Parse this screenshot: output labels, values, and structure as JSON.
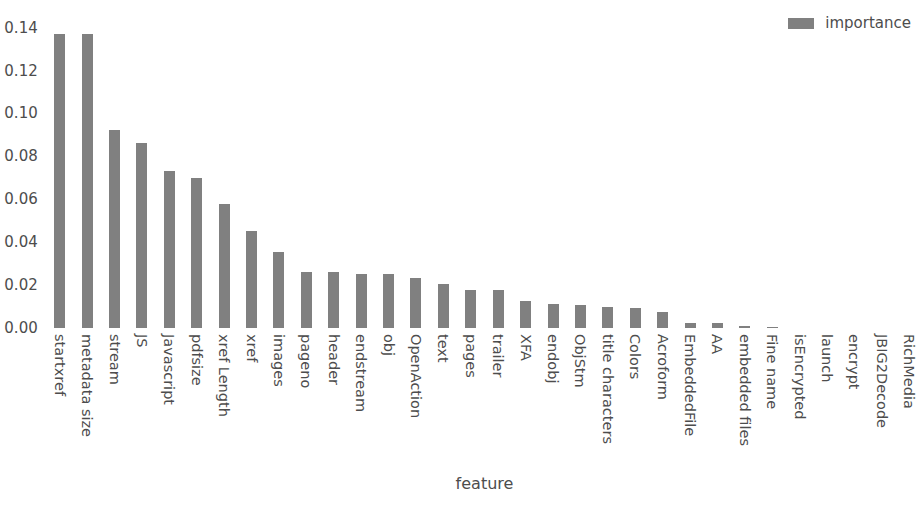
{
  "chart_data": {
    "type": "bar",
    "title": "",
    "xlabel": "feature",
    "ylabel": "",
    "ylim": [
      0.0,
      0.144
    ],
    "yticks": [
      "0.00",
      "0.02",
      "0.04",
      "0.06",
      "0.08",
      "0.10",
      "0.12",
      "0.14"
    ],
    "ytick_values": [
      0.0,
      0.02,
      0.04,
      0.06,
      0.08,
      0.1,
      0.12,
      0.14
    ],
    "grid": false,
    "legend": {
      "position": "upper right",
      "entries": [
        "importance"
      ]
    },
    "bar_color": "#808080",
    "background_color": "#ffffff",
    "text_color": "#4d4d4d",
    "categories": [
      "startxref",
      "metadata size",
      "stream",
      "JS",
      "Javascript",
      "pdfsize",
      "xref Length",
      "xref",
      "images",
      "pageno",
      "header",
      "endstream",
      "obj",
      "OpenAction",
      "text",
      "pages",
      "trailer",
      "XFA",
      "endobj",
      "ObjStm",
      "title characters",
      "Colors",
      "Acroform",
      "EmbeddedFile",
      "AA",
      "embedded files",
      "Fine name",
      "isEncrypted",
      "launch",
      "encrypt",
      "JBIG2Decode",
      "RichMedia"
    ],
    "series": [
      {
        "name": "importance",
        "values": [
          0.137,
          0.137,
          0.0925,
          0.086,
          0.073,
          0.07,
          0.058,
          0.045,
          0.0355,
          0.0262,
          0.0262,
          0.0252,
          0.025,
          0.0235,
          0.0205,
          0.0178,
          0.0178,
          0.0125,
          0.0113,
          0.0105,
          0.0098,
          0.0095,
          0.0075,
          0.0025,
          0.0022,
          0.0008,
          0.0007,
          0.0,
          0.0,
          0.0,
          0.0,
          0.0
        ]
      }
    ]
  }
}
